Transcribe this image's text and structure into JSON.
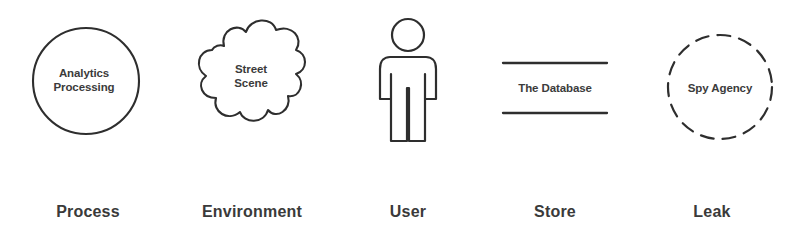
{
  "diagram": {
    "background_color": "#ffffff",
    "stroke_color": "#2e2e2e",
    "text_color": "#3a3a3a",
    "items": [
      {
        "key": "process",
        "caption": "Process",
        "inner_label": "Analytics\nProcessing",
        "shape": "circle"
      },
      {
        "key": "environment",
        "caption": "Environment",
        "inner_label": "Street\nScene",
        "shape": "cloud"
      },
      {
        "key": "user",
        "caption": "User",
        "inner_label": "",
        "shape": "person-figure"
      },
      {
        "key": "store",
        "caption": "Store",
        "inner_label": "The Database",
        "shape": "open-rectangle-two-lines"
      },
      {
        "key": "leak",
        "caption": "Leak",
        "inner_label": "Spy Agency",
        "shape": "dashed-circle"
      }
    ]
  }
}
